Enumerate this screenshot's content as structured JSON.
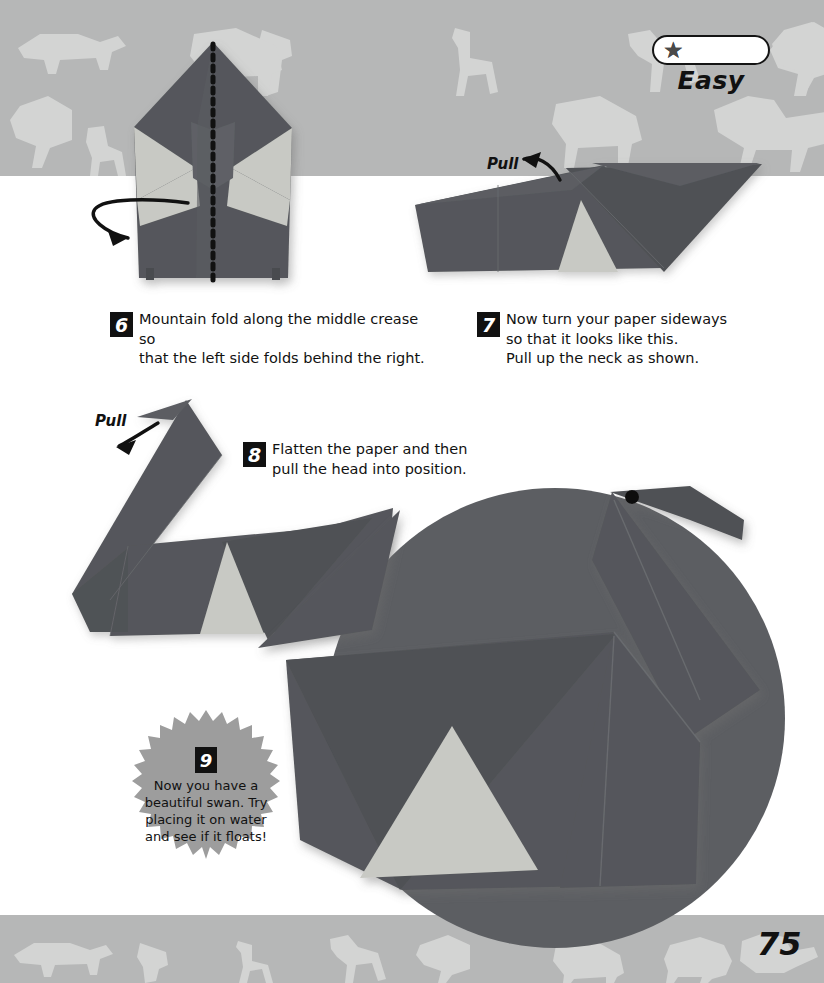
{
  "page": {
    "number": "75",
    "background_color": "#ffffff",
    "band_color": "#b6b7b7",
    "band_silhouette_color": "#d2d3d2"
  },
  "difficulty": {
    "label": "Easy",
    "stars_filled": 1,
    "stars_total": 3,
    "star_glyph": "★",
    "star_color": "#4a4a4a",
    "box_border_color": "#141414"
  },
  "paper": {
    "dark_color": "#55575b",
    "light_color": "#c8c9c4",
    "shadow_color": "#cfd0d0"
  },
  "steps": [
    {
      "number": "6",
      "text": "Mountain fold along the middle crease so\nthat the left side folds behind the right."
    },
    {
      "number": "7",
      "text": "Now turn your paper sideways\nso that it looks like this.\nPull up the neck as shown."
    },
    {
      "number": "8",
      "text": "Flatten the paper and then\npull the head into position."
    }
  ],
  "final_step": {
    "number": "9",
    "text": "Now you have a\nbeautiful swan. Try\nplacing it on water\nand see if it floats!",
    "burst_color": "#9d9d9d"
  },
  "annotations": [
    {
      "label": "Pull",
      "position": "step-7-top-left"
    },
    {
      "label": "Pull",
      "position": "step-8-top-left"
    }
  ],
  "figures": [
    {
      "name": "step-6-diagram",
      "description": "Folded swan body seen from front with dotted mountain-fold crease down the middle and a curl-over arrow on the left."
    },
    {
      "name": "step-7-diagram",
      "description": "Paper turned sideways, flat elongated shape with neck flap being pulled up."
    },
    {
      "name": "step-8-diagram",
      "description": "Swan with neck raised, head flap being pulled into position."
    },
    {
      "name": "step-9-photo",
      "description": "Large circular photo of the finished origami swan."
    }
  ]
}
